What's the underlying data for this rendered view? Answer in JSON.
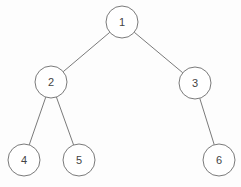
{
  "diagram": {
    "type": "binary-tree",
    "colors": {
      "stroke": "#7a7a7a",
      "fill": "#ffffff",
      "text": "#444444",
      "background": "#fdfdfd"
    },
    "node_radius": 16,
    "nodes": [
      {
        "id": "1",
        "label": "1",
        "x": 122,
        "y": 22
      },
      {
        "id": "2",
        "label": "2",
        "x": 51,
        "y": 82
      },
      {
        "id": "3",
        "label": "3",
        "x": 195,
        "y": 83
      },
      {
        "id": "4",
        "label": "4",
        "x": 24,
        "y": 160
      },
      {
        "id": "5",
        "label": "5",
        "x": 79,
        "y": 160
      },
      {
        "id": "6",
        "label": "6",
        "x": 219,
        "y": 160
      }
    ],
    "edges": [
      {
        "from": "1",
        "to": "2"
      },
      {
        "from": "1",
        "to": "3"
      },
      {
        "from": "2",
        "to": "4"
      },
      {
        "from": "2",
        "to": "5"
      },
      {
        "from": "3",
        "to": "6"
      }
    ]
  }
}
